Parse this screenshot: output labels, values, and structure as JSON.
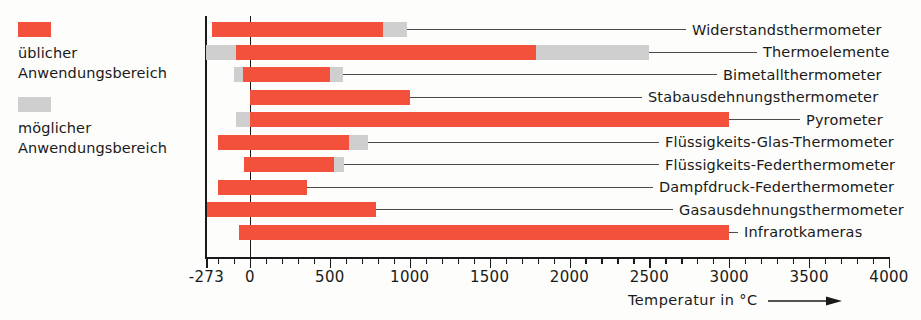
{
  "legend": {
    "items": [
      {
        "swatch": "usual",
        "color": "#f4513c",
        "label": "üblicher\nAnwendungsbereich"
      },
      {
        "swatch": "possible",
        "color": "#cfcfcf",
        "label": "möglicher\nAnwendungsbereich"
      }
    ]
  },
  "axis": {
    "title": "Temperatur in °C",
    "arrow_icon": "right-arrow-icon",
    "tick_labels": [
      "-273",
      "0",
      "500",
      "1000",
      "1500",
      "2000",
      "2500",
      "3000",
      "3500",
      "4000"
    ],
    "tick_values": [
      -273,
      0,
      500,
      1000,
      1500,
      2000,
      2500,
      3000,
      3500,
      4000
    ],
    "minor_step": 100
  },
  "chart_data": {
    "type": "bar",
    "orientation": "horizontal",
    "title": "",
    "xlabel": "Temperatur in °C",
    "ylabel": "",
    "xlim": [
      -273,
      4000
    ],
    "grid": false,
    "legend_position": "left",
    "units": "°C",
    "series": [
      {
        "name": "üblicher Anwendungsbereich",
        "color": "#f4513c"
      },
      {
        "name": "möglicher Anwendungsbereich",
        "color": "#cfcfcf"
      }
    ],
    "categories": [
      "Widerstandsthermometer",
      "Thermoelemente",
      "Bimetallthermometer",
      "Stabausdehnungsthermometer",
      "Pyrometer",
      "Flüssigkeits-Glas-Thermometer",
      "Flüssigkeits-Federthermometer",
      "Dampfdruck-Federthermometer",
      "Gasausdehnungsthermometer",
      "Infrarotkameras"
    ],
    "rows": [
      {
        "label": "Widerstandsthermometer",
        "usual": [
          -240,
          830
        ],
        "possible": [
          -240,
          980
        ]
      },
      {
        "label": "Thermoelemente",
        "usual": [
          -90,
          1790
        ],
        "possible": [
          -273,
          2500
        ]
      },
      {
        "label": "Bimetallthermometer",
        "usual": [
          -45,
          500
        ],
        "possible": [
          -100,
          580
        ]
      },
      {
        "label": "Stabausdehnungsthermometer",
        "usual": [
          0,
          1000
        ],
        "possible": null
      },
      {
        "label": "Pyrometer",
        "usual": [
          0,
          3000
        ],
        "possible": [
          -90,
          3000
        ]
      },
      {
        "label": "Flüssigkeits-Glas-Thermometer",
        "usual": [
          -200,
          620
        ],
        "possible": [
          -200,
          740
        ]
      },
      {
        "label": "Flüssigkeits-Federthermometer",
        "usual": [
          -40,
          525
        ],
        "possible": [
          -40,
          590
        ]
      },
      {
        "label": "Dampfdruck-Federthermometer",
        "usual": [
          -200,
          355
        ],
        "possible": null
      },
      {
        "label": "Gasausdehnungsthermometer",
        "usual": [
          -270,
          790
        ],
        "possible": null
      },
      {
        "label": "Infrarotkameras",
        "usual": [
          -70,
          3000
        ],
        "possible": null
      }
    ]
  }
}
